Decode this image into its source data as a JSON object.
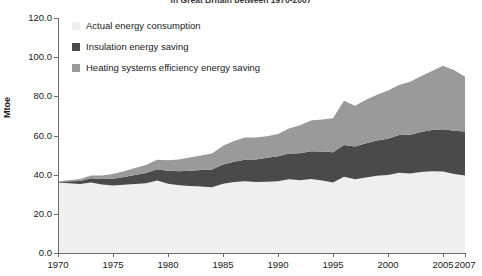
{
  "chart_data": {
    "type": "area",
    "title": "in Great Britain between 1970-2007",
    "xlabel": "",
    "ylabel": "Mtoe",
    "ylim": [
      0,
      120
    ],
    "yticks": [
      "0.0",
      "20.0",
      "40.0",
      "60.0",
      "80.0",
      "100.0",
      "120.0"
    ],
    "ytick_values": [
      0,
      20,
      40,
      60,
      80,
      100,
      120
    ],
    "xlim": [
      1970,
      2007
    ],
    "xticks": [
      "1970",
      "1975",
      "1980",
      "1985",
      "1990",
      "1995",
      "2000",
      "2005",
      "2007"
    ],
    "xtick_values": [
      1970,
      1975,
      1980,
      1985,
      1990,
      1995,
      2000,
      2005,
      2007
    ],
    "grid": false,
    "legend_position": "top-left",
    "stacked": true,
    "x": [
      1970,
      1971,
      1972,
      1973,
      1974,
      1975,
      1976,
      1977,
      1978,
      1979,
      1980,
      1981,
      1982,
      1983,
      1984,
      1985,
      1986,
      1987,
      1988,
      1989,
      1990,
      1991,
      1992,
      1993,
      1994,
      1995,
      1996,
      1997,
      1998,
      1999,
      2000,
      2001,
      2002,
      2003,
      2004,
      2005,
      2006,
      2007
    ],
    "series": [
      {
        "name": "Actual energy consumption",
        "color": "#efefef",
        "values": [
          36.0,
          35.6,
          35.2,
          36.0,
          35.0,
          34.5,
          34.8,
          35.2,
          35.6,
          37.0,
          35.4,
          34.6,
          34.2,
          34.0,
          33.6,
          35.4,
          36.2,
          36.6,
          36.2,
          36.4,
          36.6,
          37.6,
          37.2,
          37.8,
          37.0,
          36.0,
          39.0,
          37.6,
          38.6,
          39.4,
          39.8,
          41.0,
          40.6,
          41.4,
          41.8,
          41.6,
          40.4,
          39.6
        ]
      },
      {
        "name": "Insulation energy saving",
        "color": "#4a4a4a",
        "values": [
          0.4,
          1.0,
          1.6,
          2.2,
          2.8,
          3.4,
          4.0,
          4.6,
          5.2,
          5.8,
          6.6,
          7.2,
          7.8,
          8.4,
          9.0,
          9.8,
          10.4,
          11.0,
          11.6,
          12.2,
          12.8,
          13.2,
          13.8,
          14.2,
          14.8,
          15.4,
          16.2,
          16.8,
          17.4,
          18.0,
          18.6,
          19.2,
          19.8,
          20.4,
          21.0,
          21.6,
          22.0,
          22.4
        ]
      },
      {
        "name": "Heating systems efficiency energy saving",
        "color": "#9a9a9a",
        "values": [
          0.2,
          0.6,
          1.0,
          1.4,
          1.8,
          2.4,
          3.0,
          3.6,
          4.2,
          4.8,
          5.4,
          6.0,
          6.8,
          7.4,
          8.2,
          9.6,
          10.6,
          11.4,
          11.2,
          11.0,
          11.4,
          12.8,
          14.2,
          15.6,
          16.4,
          17.4,
          22.6,
          20.8,
          22.2,
          23.4,
          24.6,
          25.6,
          27.0,
          28.4,
          30.2,
          32.4,
          31.0,
          28.0
        ]
      }
    ]
  },
  "legend": {
    "items": [
      {
        "label": "Actual energy consumption",
        "color": "#efefef"
      },
      {
        "label": "Insulation energy saving",
        "color": "#4a4a4a"
      },
      {
        "label": "Heating systems efficiency energy saving",
        "color": "#9a9a9a"
      }
    ]
  }
}
